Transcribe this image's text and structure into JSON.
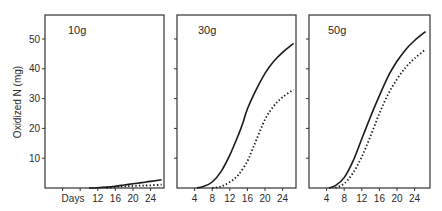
{
  "chart_data": {
    "type": "line",
    "ylabel": "Oxidized N (mg)",
    "xlabel": "Days",
    "ylim": [
      0,
      57
    ],
    "xlim": [
      0,
      27
    ],
    "yticks": [
      10,
      20,
      30,
      40,
      50
    ],
    "xticks": [
      4,
      8,
      12,
      16,
      20,
      24
    ],
    "grid": false,
    "legend": null,
    "panels": [
      {
        "title": "10g",
        "xtick_labels": [
          "",
          "",
          "12",
          "16",
          "20",
          "24"
        ],
        "series": [
          {
            "name": "solid",
            "style": "solid",
            "x": [
              10,
              12,
              14,
              16,
              18,
              20,
              22,
              24,
              26.5
            ],
            "y": [
              0,
              0.1,
              0.3,
              0.6,
              1.0,
              1.4,
              1.8,
              2.2,
              2.8
            ]
          },
          {
            "name": "dotted",
            "style": "dotted",
            "x": [
              14,
              16,
              18,
              20,
              22,
              24,
              26.5
            ],
            "y": [
              0,
              0.3,
              0.5,
              0.7,
              0.8,
              0.9,
              1.1
            ]
          }
        ]
      },
      {
        "title": "30g",
        "xtick_labels": [
          "4",
          "8",
          "12",
          "16",
          "20",
          "24"
        ],
        "series": [
          {
            "name": "solid",
            "style": "solid",
            "x": [
              4.5,
              6,
              8,
              10,
              12,
              14,
              15,
              16,
              18,
              20,
              22,
              24,
              26.5
            ],
            "y": [
              0,
              0.5,
              2,
              5.5,
              11,
              18,
              22,
              26.5,
              33,
              38.5,
              42.5,
              45.5,
              48.5
            ]
          },
          {
            "name": "dotted",
            "style": "dotted",
            "x": [
              8,
              10,
              12,
              14,
              16,
              17,
              18,
              20,
              22,
              24,
              26.5
            ],
            "y": [
              0,
              0.5,
              2,
              4.5,
              9,
              12.5,
              16,
              23,
              27.5,
              30.5,
              33
            ]
          }
        ]
      },
      {
        "title": "50g",
        "xtick_labels": [
          "4",
          "8",
          "12",
          "16",
          "20",
          "24"
        ],
        "series": [
          {
            "name": "solid",
            "style": "solid",
            "x": [
              4.5,
              6,
              8,
              10,
              12,
              14,
              16,
              18,
              20,
              22,
              24,
              26.5
            ],
            "y": [
              0,
              0.8,
              3.5,
              9,
              16.5,
              24,
              31,
              37.5,
              42.5,
              46.5,
              49.5,
              52.5
            ]
          },
          {
            "name": "dotted",
            "style": "dotted",
            "x": [
              6,
              8,
              10,
              12,
              14,
              16,
              18,
              20,
              22,
              24,
              26.5
            ],
            "y": [
              0,
              1.5,
              5,
              10.5,
              17.5,
              25,
              31.5,
              36.5,
              40.5,
              43.5,
              46.5
            ]
          }
        ]
      }
    ]
  },
  "figure": {
    "ylabel": "Oxidized N (mg)",
    "days_label": "Days",
    "ytick_labels": [
      "10",
      "20",
      "30",
      "40",
      "50"
    ]
  }
}
